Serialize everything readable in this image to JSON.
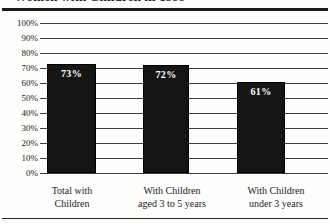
{
  "figure": {
    "title_fragment": "Women with Children in 1999",
    "header_rule": true,
    "footer_rule": true
  },
  "chart_data": {
    "type": "bar",
    "title": "Women with Children in 1999",
    "xlabel": "",
    "ylabel": "",
    "ylim": [
      0,
      100
    ],
    "grid": true,
    "legend": null,
    "categories": [
      "Total with Children",
      "With Children aged 3 to 5 years",
      "With Children under 3 years"
    ],
    "category_lines": [
      [
        "Total with",
        "Children"
      ],
      [
        "With Children",
        "aged 3 to 5 years"
      ],
      [
        "With Children",
        "under 3 years"
      ]
    ],
    "values": [
      73,
      72,
      61
    ],
    "value_labels": [
      "73%",
      "72%",
      "61%"
    ],
    "ytick_labels": [
      "100%",
      "90%",
      "80%",
      "70%",
      "60%",
      "50%",
      "40%",
      "30%",
      "20%",
      "10%",
      "0%"
    ],
    "ytick_values": [
      100,
      90,
      80,
      70,
      60,
      50,
      40,
      30,
      20,
      10,
      0
    ],
    "colors": {
      "bar_fill": "#151515",
      "bar_label": "#ffffff",
      "gridline": "#3d3d3d",
      "axis_text": "#1c1c1c",
      "background": "#fdfdfc",
      "rule": "#1b1b1b"
    }
  }
}
